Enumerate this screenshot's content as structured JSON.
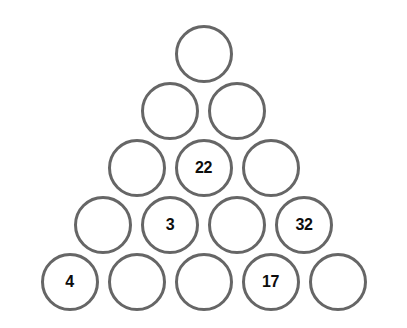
{
  "puzzle": {
    "type": "number-pyramid",
    "shape": "triangle",
    "rows_count": 5,
    "circle_outline_color": "#666666",
    "circle_fill_color": "#ffffff",
    "value_text_color": "#0d0d0d",
    "background_color": "#ffffff",
    "rows": [
      {
        "index": 1,
        "cells": [
          {
            "value": ""
          }
        ]
      },
      {
        "index": 2,
        "cells": [
          {
            "value": ""
          },
          {
            "value": ""
          }
        ]
      },
      {
        "index": 3,
        "cells": [
          {
            "value": ""
          },
          {
            "value": "22"
          },
          {
            "value": ""
          }
        ]
      },
      {
        "index": 4,
        "cells": [
          {
            "value": ""
          },
          {
            "value": "3"
          },
          {
            "value": ""
          },
          {
            "value": "32"
          }
        ]
      },
      {
        "index": 5,
        "cells": [
          {
            "value": "4"
          },
          {
            "value": ""
          },
          {
            "value": ""
          },
          {
            "value": "17"
          },
          {
            "value": ""
          }
        ]
      }
    ]
  }
}
